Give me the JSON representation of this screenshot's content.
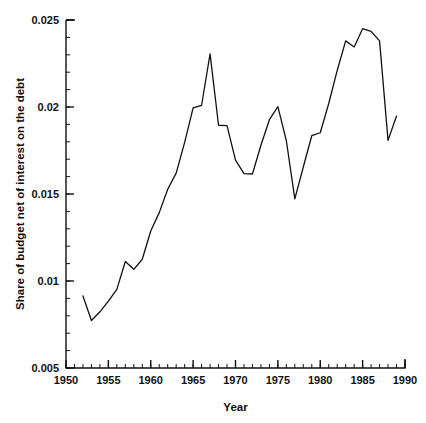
{
  "chart_data": {
    "type": "line",
    "title": "",
    "xlabel": "Year",
    "ylabel": "Share of budget net of interest on the debt",
    "xlim": [
      1950,
      1990
    ],
    "ylim": [
      0.005,
      0.025
    ],
    "grid": false,
    "legend": null,
    "x_major_ticks": [
      1950,
      1955,
      1960,
      1965,
      1970,
      1975,
      1980,
      1985,
      1990
    ],
    "x_major_tick_labels": [
      "1950",
      "1955",
      "1960",
      "1965",
      "1970",
      "1975",
      "1980",
      "1985",
      "1990"
    ],
    "x_minor_tick_step": 1,
    "y_major_ticks": [
      0.005,
      0.01,
      0.015,
      0.02,
      0.025
    ],
    "y_major_tick_labels": [
      "0.005",
      "0.01",
      "0.015",
      "0.02",
      "0.025"
    ],
    "y_minor_tick_step": 0.001,
    "line_color": "#111111",
    "line_width": 1.3,
    "x": [
      1952,
      1953,
      1954,
      1955,
      1956,
      1957,
      1958,
      1959,
      1960,
      1961,
      1962,
      1963,
      1964,
      1965,
      1966,
      1967,
      1968,
      1969,
      1970,
      1971,
      1972,
      1973,
      1974,
      1975,
      1976,
      1977,
      1978,
      1979,
      1980,
      1981,
      1982,
      1983,
      1984,
      1985,
      1986,
      1987,
      1988,
      1989
    ],
    "values": [
      0.00914,
      0.00773,
      0.00823,
      0.00884,
      0.00952,
      0.01112,
      0.01067,
      0.01125,
      0.01287,
      0.01393,
      0.01527,
      0.0162,
      0.01797,
      0.01995,
      0.0201,
      0.02305,
      0.01895,
      0.01893,
      0.01695,
      0.01617,
      0.01615,
      0.0178,
      0.01927,
      0.02002,
      0.01806,
      0.01472,
      0.01655,
      0.01835,
      0.01852,
      0.0202,
      0.0221,
      0.0238,
      0.02345,
      0.0245,
      0.02435,
      0.0238,
      0.01808,
      0.01948
    ]
  },
  "figure": {
    "ylabel": "Share of budget net of interest on the debt",
    "xlabel": "Year",
    "y_tick_labels": [
      "0.025",
      "0.02",
      "0.015",
      "0.01",
      "0.005"
    ],
    "x_tick_labels": [
      "1950",
      "1955",
      "1960",
      "1965",
      "1970",
      "1975",
      "1980",
      "1985",
      "1990"
    ]
  }
}
